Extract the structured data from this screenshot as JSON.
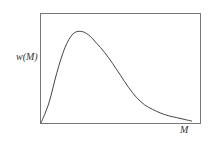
{
  "chart_data": {
    "type": "line",
    "title": "",
    "xlabel": "M",
    "ylabel": "w(M)",
    "grid": false,
    "legend": null,
    "series": [
      {
        "name": "w(M)",
        "x": [
          0,
          0.05,
          0.1,
          0.15,
          0.2,
          0.25,
          0.3,
          0.35,
          0.4,
          0.45,
          0.5,
          0.55,
          0.6,
          0.65,
          0.7,
          0.75,
          0.8,
          0.85,
          0.9,
          0.95
        ],
        "values": [
          0,
          0.22,
          0.55,
          0.82,
          0.97,
          1.0,
          0.96,
          0.87,
          0.77,
          0.65,
          0.52,
          0.39,
          0.28,
          0.2,
          0.15,
          0.11,
          0.08,
          0.06,
          0.04,
          0.02
        ]
      }
    ],
    "xlim": [
      0,
      1
    ],
    "ylim": [
      0,
      1.2
    ]
  },
  "labels": {
    "y_axis": "w(M)",
    "x_axis": "M"
  }
}
